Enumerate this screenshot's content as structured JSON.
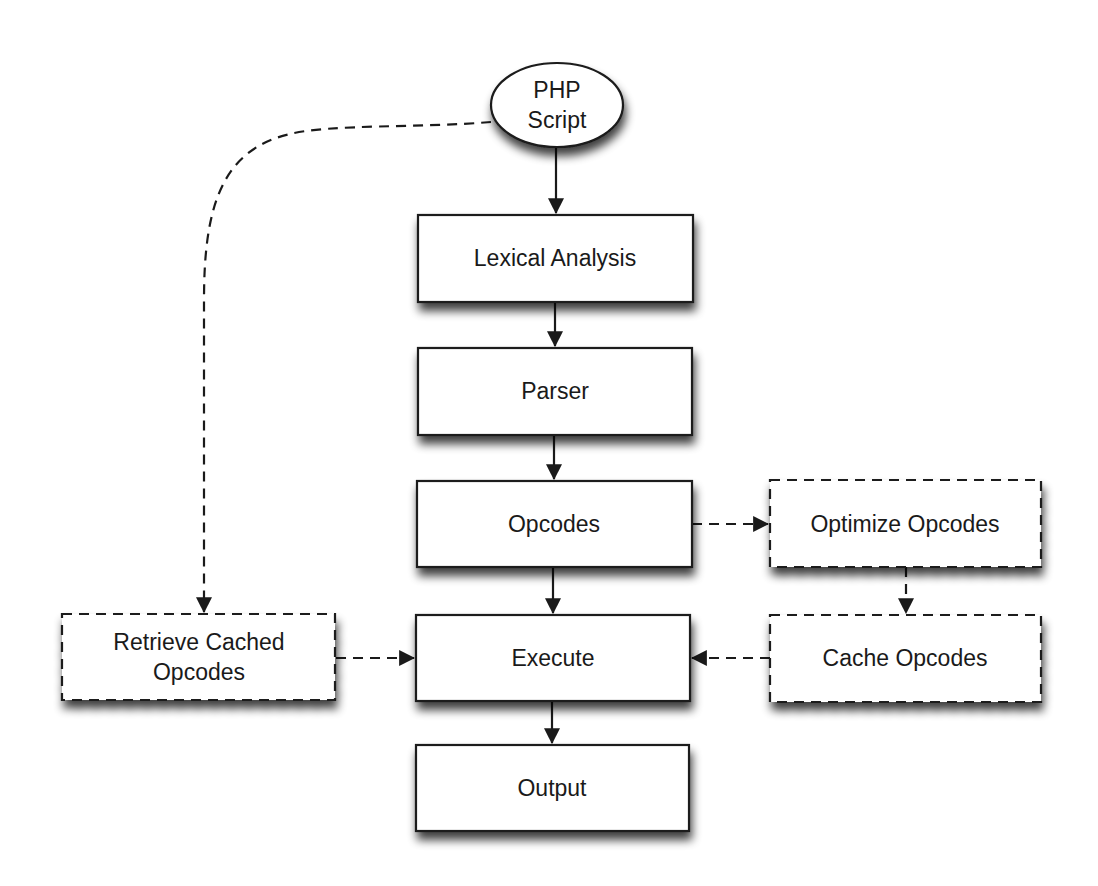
{
  "diagram": {
    "colors": {
      "background": "#ffffff",
      "stroke": "#1a1a1a",
      "node_fill": "#ffffff",
      "shadow": "#555555"
    },
    "nodes": {
      "php_script": {
        "line1": "PHP",
        "line2": "Script",
        "shape": "ellipse"
      },
      "lexical_analysis": {
        "label": "Lexical Analysis",
        "shape": "rect"
      },
      "parser": {
        "label": "Parser",
        "shape": "rect"
      },
      "opcodes": {
        "label": "Opcodes",
        "shape": "rect"
      },
      "execute": {
        "label": "Execute",
        "shape": "rect"
      },
      "output": {
        "label": "Output",
        "shape": "rect"
      },
      "optimize_opcodes": {
        "label": "Optimize Opcodes",
        "shape": "dashed-rect"
      },
      "cache_opcodes": {
        "label": "Cache Opcodes",
        "shape": "dashed-rect"
      },
      "retrieve_cached_opcodes": {
        "line1": "Retrieve Cached",
        "line2": "Opcodes",
        "shape": "dashed-rect"
      }
    },
    "edges": [
      {
        "from": "PHP Script",
        "to": "Lexical Analysis",
        "style": "solid"
      },
      {
        "from": "Lexical Analysis",
        "to": "Parser",
        "style": "solid"
      },
      {
        "from": "Parser",
        "to": "Opcodes",
        "style": "solid"
      },
      {
        "from": "Opcodes",
        "to": "Execute",
        "style": "solid"
      },
      {
        "from": "Execute",
        "to": "Output",
        "style": "solid"
      },
      {
        "from": "Opcodes",
        "to": "Optimize Opcodes",
        "style": "dashed"
      },
      {
        "from": "Optimize Opcodes",
        "to": "Cache Opcodes",
        "style": "dashed"
      },
      {
        "from": "Cache Opcodes",
        "to": "Execute",
        "style": "dashed"
      },
      {
        "from": "PHP Script",
        "to": "Retrieve Cached Opcodes",
        "style": "dashed"
      },
      {
        "from": "Retrieve Cached Opcodes",
        "to": "Execute",
        "style": "dashed"
      }
    ]
  }
}
